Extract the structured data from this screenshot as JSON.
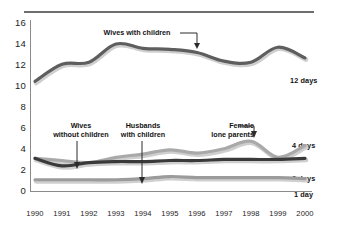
{
  "chart_data": {
    "type": "line",
    "title": "",
    "xlabel": "",
    "ylabel": "",
    "x": [
      1990,
      1991,
      1992,
      1993,
      1994,
      1995,
      1996,
      1997,
      1998,
      1999,
      2000
    ],
    "xlim": [
      1990,
      2000
    ],
    "ylim": [
      0,
      16
    ],
    "yticks": [
      0,
      2,
      4,
      6,
      8,
      10,
      12,
      14,
      16
    ],
    "xticks": [
      "1990",
      "1991",
      "1992",
      "1993",
      "1994",
      "1995",
      "1996",
      "1997",
      "1998",
      "1999",
      "2000"
    ],
    "grid": false,
    "legend": "right-end-labels",
    "series": [
      {
        "name": "Wives with children",
        "end_label": "12 days",
        "color": "#5e5e5e",
        "values": [
          10.3,
          11.9,
          12.1,
          13.8,
          13.4,
          13.3,
          13.0,
          12.2,
          12.1,
          13.5,
          12.5
        ]
      },
      {
        "name": "Female lone parents",
        "end_label": "4 days",
        "color": "#a9a9a9",
        "values": [
          3.1,
          2.9,
          2.7,
          3.2,
          3.5,
          3.9,
          3.6,
          4.0,
          4.7,
          3.2,
          4.3
        ]
      },
      {
        "name": "Wives without children",
        "end_label": "3 days",
        "color": "#3a3a3a",
        "values": [
          3.1,
          2.4,
          2.7,
          2.8,
          2.8,
          2.9,
          2.9,
          3.0,
          3.0,
          3.0,
          3.1
        ]
      },
      {
        "name": "Husbands with children",
        "end_label": "1 day",
        "color": "#9b9b9b",
        "values": [
          1.1,
          1.1,
          1.1,
          1.1,
          1.2,
          1.4,
          1.3,
          1.3,
          1.3,
          1.3,
          1.2
        ]
      }
    ],
    "annotations": [
      {
        "name": "wives-with-children",
        "text_line1": "Wives with children",
        "text_line2": ""
      },
      {
        "name": "wives-without-children",
        "text_line1": "Wives",
        "text_line2": "without children"
      },
      {
        "name": "husbands-with-children",
        "text_line1": "Husbands",
        "text_line2": "with children"
      },
      {
        "name": "female-lone-parents",
        "text_line1": "Female",
        "text_line2": "lone parents"
      }
    ]
  },
  "axis": {
    "y": {
      "t16": "16",
      "t14": "14",
      "t12": "12",
      "t10": "10",
      "t8": "8",
      "t6": "6",
      "t4": "4",
      "t2": "2",
      "t0": "0"
    },
    "x": {
      "x1990": "1990",
      "x1991": "1991",
      "x1992": "1992",
      "x1993": "1993",
      "x1994": "1994",
      "x1995": "1995",
      "x1996": "1996",
      "x1997": "1997",
      "x1998": "1998",
      "x1999": "1999",
      "x2000": "2000"
    }
  },
  "series_labels": {
    "twelve_days": "12 days",
    "four_days": "4 days",
    "three_days": "3 days",
    "one_day": "1 day"
  },
  "annotations": {
    "wives_with_children": "Wives with children",
    "wives_without_1": "Wives",
    "wives_without_2": "without children",
    "husbands_1": "Husbands",
    "husbands_2": "with children",
    "female_lone_1": "Female",
    "female_lone_2": "lone parents"
  },
  "colors": {
    "series_top": "#5e5e5e",
    "series_female": "#a9a9a9",
    "series_wives": "#3a3a3a",
    "series_husbands": "#9b9b9b",
    "axis": "#6e6e6e",
    "text": "#141414"
  }
}
